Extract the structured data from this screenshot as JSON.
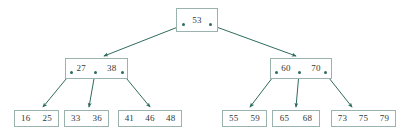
{
  "diagram": {
    "type": "b-tree",
    "colors": {
      "node_border": "#9ab3ae",
      "node_fill": "#ffffff",
      "edge": "#2f6b5e",
      "text": "#303838",
      "background": "#ffffff"
    },
    "nodes": [
      {
        "id": "root",
        "role": "root",
        "keys": [
          "53"
        ],
        "x": 176,
        "y": 8,
        "w": 42,
        "h": 24,
        "pointers": [
          {
            "x": 183,
            "y": 24
          },
          {
            "x": 210,
            "y": 24
          }
        ]
      },
      {
        "id": "internal-left",
        "role": "internal",
        "keys": [
          "27",
          "38"
        ],
        "x": 65,
        "y": 58,
        "w": 63,
        "h": 21,
        "pointers": [
          {
            "x": 71,
            "y": 72
          },
          {
            "x": 95,
            "y": 72
          },
          {
            "x": 122,
            "y": 72
          }
        ]
      },
      {
        "id": "internal-right",
        "role": "internal",
        "keys": [
          "60",
          "70"
        ],
        "x": 270,
        "y": 58,
        "w": 62,
        "h": 21,
        "pointers": [
          {
            "x": 276,
            "y": 72
          },
          {
            "x": 299,
            "y": 72
          },
          {
            "x": 325,
            "y": 72
          }
        ]
      },
      {
        "id": "leaf-1",
        "role": "leaf",
        "keys": [
          "16",
          "25"
        ],
        "x": 14,
        "y": 110,
        "w": 45,
        "h": 17,
        "pointers": []
      },
      {
        "id": "leaf-2",
        "role": "leaf",
        "keys": [
          "33",
          "36"
        ],
        "x": 64,
        "y": 110,
        "w": 45,
        "h": 17,
        "pointers": []
      },
      {
        "id": "leaf-3",
        "role": "leaf",
        "keys": [
          "41",
          "46",
          "48"
        ],
        "x": 118,
        "y": 110,
        "w": 64,
        "h": 17,
        "pointers": []
      },
      {
        "id": "leaf-4",
        "role": "leaf",
        "keys": [
          "55",
          "59"
        ],
        "x": 222,
        "y": 110,
        "w": 45,
        "h": 17,
        "pointers": []
      },
      {
        "id": "leaf-5",
        "role": "leaf",
        "keys": [
          "65",
          "68"
        ],
        "x": 272,
        "y": 110,
        "w": 48,
        "h": 17,
        "pointers": []
      },
      {
        "id": "leaf-6",
        "role": "leaf",
        "keys": [
          "73",
          "75",
          "79"
        ],
        "x": 331,
        "y": 110,
        "w": 65,
        "h": 17,
        "pointers": []
      }
    ],
    "edges": [
      {
        "from": "root",
        "to": "internal-left",
        "x1": 183,
        "y1": 25,
        "x2": 104,
        "y2": 56
      },
      {
        "from": "root",
        "to": "internal-right",
        "x1": 211,
        "y1": 25,
        "x2": 296,
        "y2": 56
      },
      {
        "from": "internal-left",
        "to": "leaf-1",
        "x1": 71,
        "y1": 73,
        "x2": 43,
        "y2": 107
      },
      {
        "from": "internal-left",
        "to": "leaf-2",
        "x1": 95,
        "y1": 73,
        "x2": 89,
        "y2": 107
      },
      {
        "from": "internal-left",
        "to": "leaf-3",
        "x1": 122,
        "y1": 73,
        "x2": 150,
        "y2": 107
      },
      {
        "from": "internal-right",
        "to": "leaf-4",
        "x1": 276,
        "y1": 73,
        "x2": 250,
        "y2": 107
      },
      {
        "from": "internal-right",
        "to": "leaf-5",
        "x1": 299,
        "y1": 73,
        "x2": 296,
        "y2": 107
      },
      {
        "from": "internal-right",
        "to": "leaf-6",
        "x1": 325,
        "y1": 73,
        "x2": 352,
        "y2": 107
      }
    ]
  }
}
